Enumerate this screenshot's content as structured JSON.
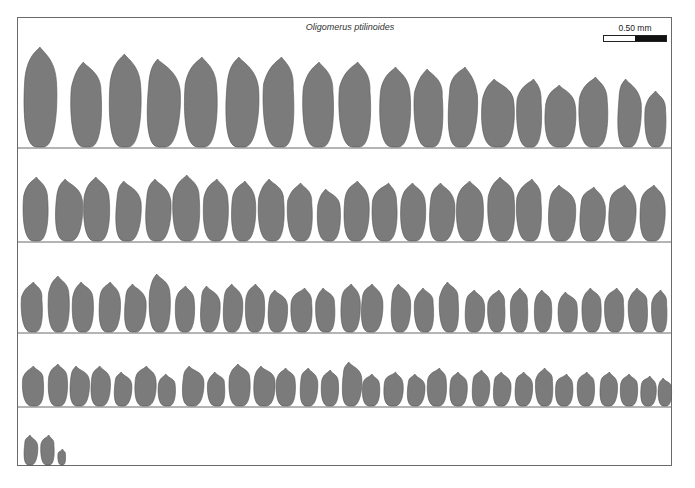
{
  "figure": {
    "title": "Oligomerus ptilinoides",
    "scale_bar": {
      "label": "0.50 mm",
      "colors": {
        "left": "#ffffff",
        "right": "#111111"
      }
    },
    "grain_fill": "#7b7b7b",
    "grain_stroke": "#555555",
    "frame_color": "#6a6a6a",
    "rows": [
      {
        "baseline": 148,
        "count": 20,
        "items": [
          [
            40,
            34,
            100
          ],
          [
            87,
            32,
            85
          ],
          [
            125,
            33,
            93
          ],
          [
            162,
            34,
            88
          ],
          [
            201,
            34,
            90
          ],
          [
            241,
            34,
            90
          ],
          [
            280,
            32,
            90
          ],
          [
            319,
            32,
            85
          ],
          [
            356,
            33,
            85
          ],
          [
            395,
            32,
            80
          ],
          [
            430,
            30,
            78
          ],
          [
            461,
            30,
            80
          ],
          [
            498,
            34,
            68
          ],
          [
            530,
            26,
            68
          ],
          [
            560,
            32,
            62
          ],
          [
            594,
            30,
            70
          ],
          [
            628,
            24,
            68
          ],
          [
            656,
            22,
            56
          ]
        ]
      },
      {
        "baseline": 242,
        "count": 22,
        "items": [
          [
            36,
            26,
            64
          ],
          [
            68,
            28,
            62
          ],
          [
            97,
            27,
            64
          ],
          [
            127,
            26,
            60
          ],
          [
            157,
            26,
            62
          ],
          [
            187,
            28,
            66
          ],
          [
            216,
            26,
            62
          ],
          [
            243,
            25,
            60
          ],
          [
            272,
            27,
            62
          ],
          [
            301,
            26,
            58
          ],
          [
            329,
            24,
            52
          ],
          [
            356,
            26,
            60
          ],
          [
            385,
            26,
            58
          ],
          [
            413,
            26,
            58
          ],
          [
            441,
            26,
            58
          ],
          [
            470,
            28,
            60
          ],
          [
            502,
            28,
            64
          ],
          [
            530,
            26,
            62
          ],
          [
            561,
            28,
            56
          ],
          [
            591,
            26,
            54
          ],
          [
            621,
            28,
            56
          ],
          [
            652,
            26,
            56
          ]
        ]
      },
      {
        "baseline": 333,
        "count": 34,
        "items": [
          [
            33,
            22,
            50
          ],
          [
            59,
            22,
            56
          ],
          [
            83,
            22,
            50
          ],
          [
            109,
            22,
            50
          ],
          [
            134,
            22,
            48
          ],
          [
            160,
            22,
            58
          ],
          [
            185,
            20,
            46
          ],
          [
            209,
            20,
            46
          ],
          [
            232,
            20,
            48
          ],
          [
            255,
            20,
            48
          ],
          [
            277,
            20,
            42
          ],
          [
            302,
            22,
            44
          ],
          [
            326,
            20,
            44
          ],
          [
            350,
            20,
            48
          ],
          [
            371,
            22,
            48
          ],
          [
            400,
            20,
            48
          ],
          [
            425,
            20,
            44
          ],
          [
            450,
            20,
            50
          ],
          [
            474,
            20,
            42
          ],
          [
            497,
            18,
            42
          ],
          [
            520,
            18,
            44
          ],
          [
            543,
            18,
            42
          ],
          [
            568,
            20,
            40
          ],
          [
            592,
            20,
            44
          ],
          [
            615,
            20,
            44
          ],
          [
            639,
            20,
            44
          ],
          [
            660,
            16,
            42
          ]
        ]
      },
      {
        "baseline": 407,
        "count": 32,
        "items": [
          [
            34,
            22,
            40
          ],
          [
            58,
            20,
            42
          ],
          [
            79,
            20,
            40
          ],
          [
            100,
            20,
            40
          ],
          [
            122,
            18,
            34
          ],
          [
            145,
            22,
            40
          ],
          [
            167,
            18,
            32
          ],
          [
            192,
            22,
            40
          ],
          [
            217,
            18,
            34
          ],
          [
            240,
            22,
            42
          ],
          [
            264,
            22,
            40
          ],
          [
            286,
            20,
            38
          ],
          [
            308,
            18,
            38
          ],
          [
            330,
            18,
            36
          ],
          [
            351,
            20,
            44
          ],
          [
            371,
            18,
            32
          ],
          [
            393,
            20,
            34
          ],
          [
            415,
            18,
            32
          ],
          [
            437,
            20,
            38
          ],
          [
            458,
            18,
            34
          ],
          [
            480,
            18,
            36
          ],
          [
            501,
            18,
            34
          ],
          [
            523,
            18,
            34
          ],
          [
            545,
            18,
            38
          ],
          [
            564,
            18,
            32
          ],
          [
            586,
            18,
            34
          ],
          [
            608,
            18,
            34
          ],
          [
            629,
            18,
            32
          ],
          [
            648,
            16,
            30
          ],
          [
            665,
            14,
            28
          ]
        ]
      },
      {
        "baseline": 466,
        "count": 3,
        "items": [
          [
            30,
            14,
            30
          ],
          [
            48,
            14,
            30
          ],
          [
            62,
            8,
            16
          ]
        ]
      }
    ],
    "dividers": [
      148,
      242,
      333,
      407
    ]
  }
}
